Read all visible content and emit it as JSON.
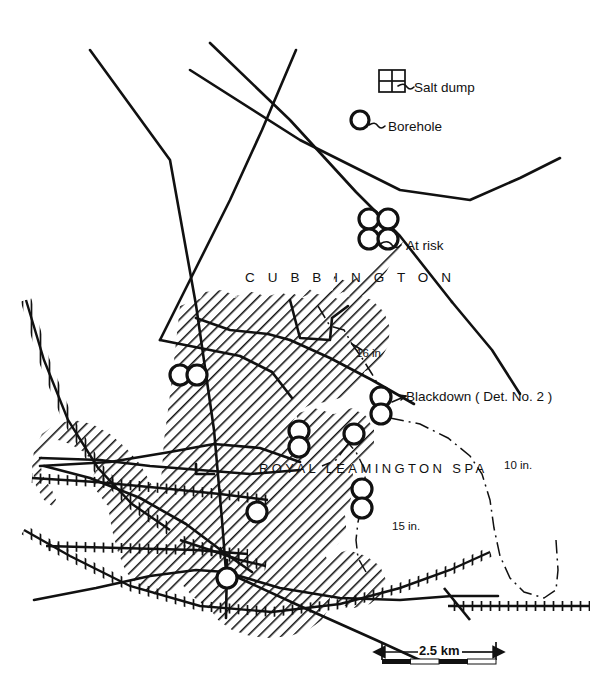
{
  "figure": {
    "kind": "map",
    "region": "Royal Leamington Spa and Cubbington",
    "background_color": "#ffffff",
    "ink_color": "#111111"
  },
  "labels": {
    "cubbington": "C U B B I N G T O N",
    "royal_leamington_spa": "ROYAL  LEAMINGTON  SPA"
  },
  "legend": {
    "salt_dump": "Salt dump",
    "borehole": "Borehole",
    "at_risk": "At risk"
  },
  "annotations": {
    "blackdown": "Blackdown  ( Det. No. 2 )"
  },
  "contours": [
    {
      "label": "16 in",
      "value": 16,
      "unit": "in"
    },
    {
      "label": "15 in.",
      "value": 15,
      "unit": "in"
    },
    {
      "label": "10 in.",
      "value": 10,
      "unit": "in"
    }
  ],
  "scale_bar": {
    "label": "2.5 km",
    "distance": 2.5,
    "unit": "km",
    "segments": 4
  },
  "boreholes": [
    {
      "name": "legend-borehole",
      "cx": 360,
      "cy": 120,
      "r": 9
    },
    {
      "name": "at-risk-1",
      "cx": 369,
      "cy": 219,
      "r": 10
    },
    {
      "name": "at-risk-2",
      "cx": 388,
      "cy": 219,
      "r": 10
    },
    {
      "name": "at-risk-3",
      "cx": 369,
      "cy": 239,
      "r": 10
    },
    {
      "name": "at-risk-4",
      "cx": 388,
      "cy": 239,
      "r": 10
    },
    {
      "name": "west-pair-1",
      "cx": 180,
      "cy": 375,
      "r": 10
    },
    {
      "name": "west-pair-2",
      "cx": 197,
      "cy": 375,
      "r": 10
    },
    {
      "name": "blackdown-upper",
      "cx": 381,
      "cy": 397,
      "r": 10
    },
    {
      "name": "blackdown-lower",
      "cx": 381,
      "cy": 414,
      "r": 10
    },
    {
      "name": "central-pair-upper",
      "cx": 299,
      "cy": 431,
      "r": 10
    },
    {
      "name": "central-pair-lower",
      "cx": 299,
      "cy": 447,
      "r": 10
    },
    {
      "name": "leamington-north",
      "cx": 354,
      "cy": 434,
      "r": 10
    },
    {
      "name": "leamington-south-upper",
      "cx": 362,
      "cy": 489,
      "r": 10
    },
    {
      "name": "leamington-south-lower",
      "cx": 362,
      "cy": 508,
      "r": 10
    },
    {
      "name": "urban-single",
      "cx": 257,
      "cy": 512,
      "r": 10
    },
    {
      "name": "station-borehole",
      "cx": 227,
      "cy": 578,
      "r": 10
    }
  ],
  "salt_dump_symbol": {
    "x": 379,
    "y": 70,
    "width": 26,
    "height": 22
  }
}
